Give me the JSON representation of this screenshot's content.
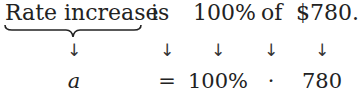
{
  "sentence": {
    "words": [
      "Rate increase",
      "is",
      "100%",
      "of",
      "$780."
    ]
  },
  "translation": {
    "symbols": [
      "a",
      "=",
      "100%",
      "·",
      "780"
    ]
  },
  "arrows": [
    "↓",
    "↓",
    "↓",
    "↓",
    "↓"
  ]
}
